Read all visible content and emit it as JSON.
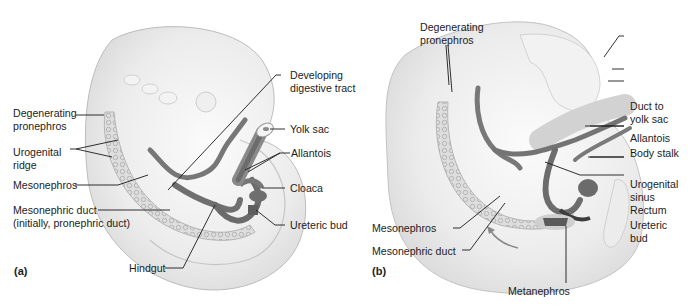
{
  "figure": {
    "colors": {
      "background": "#ffffff",
      "embryo_fill": "#ececec",
      "embryo_edge": "#b9b9b9",
      "gut_fill": "#7a7a7a",
      "gut_dark": "#5a5a5a",
      "leader_line": "#1a1a1a",
      "text": "#1c1c1c"
    },
    "panel_a": {
      "tag": "(a)",
      "labels": {
        "developing_digestive_tract_1": "Developing",
        "developing_digestive_tract_2": "digestive tract",
        "degenerating_pronephros_1": "Degenerating",
        "degenerating_pronephros_2": "pronephros",
        "yolk_sac": "Yolk sac",
        "urogenital_ridge_1": "Urogenital",
        "urogenital_ridge_2": "ridge",
        "allantois": "Allantois",
        "mesonephros": "Mesonephros",
        "cloaca": "Cloaca",
        "mesonephric_duct_1": "Mesonephric duct",
        "mesonephric_duct_2": "(initially, pronephric duct)",
        "ureteric_bud": "Ureteric bud",
        "hindgut": "Hindgut"
      }
    },
    "panel_b": {
      "tag": "(b)",
      "labels": {
        "degenerating_pronephros_1": "Degenerating",
        "degenerating_pronephros_2": "pronephros",
        "duct_to_yolk_sac_1": "Duct to",
        "duct_to_yolk_sac_2": "yolk sac",
        "allantois": "Allantois",
        "body_stalk": "Body stalk",
        "urogenital_sinus_1": "Urogenital",
        "urogenital_sinus_2": "sinus",
        "rectum": "Rectum",
        "ureteric_bud_1": "Ureteric",
        "ureteric_bud_2": "bud",
        "mesonephros": "Mesonephros",
        "mesonephric_duct": "Mesonephric duct",
        "metanephros": "Metanephros"
      }
    }
  }
}
